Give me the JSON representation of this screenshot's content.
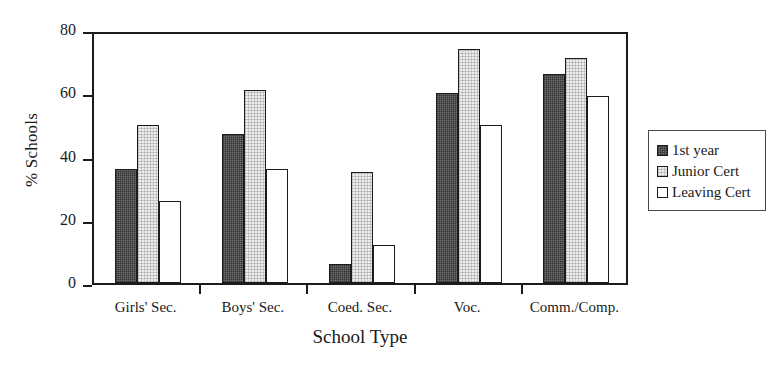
{
  "chart_data": {
    "type": "bar",
    "title": "",
    "xlabel": "School Type",
    "ylabel": "% Schools",
    "categories": [
      "Girls' Sec.",
      "Boys' Sec.",
      "Coed. Sec.",
      "Voc.",
      "Comm./Comp."
    ],
    "series": [
      {
        "name": "1st year",
        "values": [
          36,
          47,
          6,
          60,
          66
        ]
      },
      {
        "name": "Junior Cert",
        "values": [
          50,
          61,
          35,
          74,
          71
        ]
      },
      {
        "name": "Leaving Cert",
        "values": [
          26,
          36,
          12,
          50,
          59
        ]
      }
    ],
    "ylim": [
      0,
      80
    ],
    "yticks": [
      0,
      20,
      40,
      60,
      80
    ],
    "ytick_labels": [
      "0",
      "20",
      "40",
      "60",
      "80"
    ],
    "grid": false,
    "legend_position": "right",
    "colors": {
      "series_1st_year": "#6e6e6e",
      "series_junior_cert": "#ececec",
      "series_leaving_cert": "#ffffff",
      "axis": "#1c1c1c",
      "background": "#ffffff"
    }
  }
}
